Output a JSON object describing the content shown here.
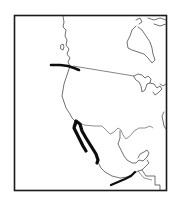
{
  "map": {
    "region": "Western North America",
    "frame": {
      "x": 14,
      "y": 15,
      "width": 153,
      "height": 176,
      "color": "#1a1a1a"
    },
    "colors": {
      "background": "#ffffff",
      "coastline": "#333333",
      "range_marker": "#0d0d0d"
    },
    "range_markers": [
      {
        "id": "pacific-northwest",
        "label": ""
      },
      {
        "id": "baja-peninsula",
        "label": ""
      },
      {
        "id": "west-mexico-coast",
        "label": ""
      },
      {
        "id": "southern-mexico",
        "label": ""
      }
    ],
    "connector_line": {
      "from": "pacific-northwest",
      "to": "great-lakes"
    }
  }
}
